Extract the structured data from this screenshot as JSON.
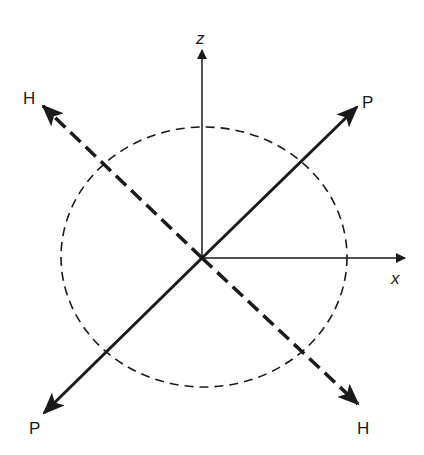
{
  "diagram": {
    "labels": {
      "z_axis": "z",
      "x_axis": "x",
      "p_top": "P",
      "p_bottom": "P",
      "h_top": "H",
      "h_bottom": "H"
    },
    "elements": [
      {
        "name": "z-axis",
        "style": "solid thin arrow",
        "direction": "up"
      },
      {
        "name": "x-axis",
        "style": "solid thin arrow",
        "direction": "right"
      },
      {
        "name": "P-axis",
        "style": "solid thick double arrow",
        "direction": "diagonal lower-left to upper-right"
      },
      {
        "name": "H-axis",
        "style": "dashed thick double arrow",
        "direction": "diagonal upper-left to lower-right"
      },
      {
        "name": "circle",
        "style": "dashed thin"
      }
    ],
    "colors": {
      "ink": "#1a1a1a",
      "background": "#ffffff"
    }
  }
}
